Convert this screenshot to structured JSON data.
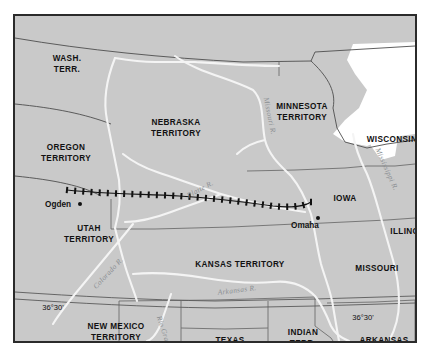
{
  "map": {
    "title": "Union Pacific Railroad route across western territories, c. 1860",
    "frame": {
      "border_color": "#2b2b2b",
      "land_color": "#c9c9c9",
      "water_color": "#ffffff",
      "river_color": "#f2f2f2",
      "boundary_color": "#6a6a6a",
      "label_color": "#111111",
      "river_label_color": "#8b8f93",
      "railroad_color": "#111111"
    },
    "regions": [
      {
        "name": "wash-terr",
        "label": "WASH.\nTERR.",
        "lines": [
          "WASH.",
          "TERR."
        ],
        "x": 52,
        "y": 48
      },
      {
        "name": "oregon-territory",
        "label": "OREGON\nTERRITORY",
        "lines": [
          "OREGON",
          "TERRITORY"
        ],
        "x": 51,
        "y": 137
      },
      {
        "name": "utah-territory",
        "label": "UTAH\nTERRITORY",
        "lines": [
          "UTAH",
          "TERRITORY"
        ],
        "x": 74,
        "y": 218
      },
      {
        "name": "new-mexico-territory",
        "label": "NEW MEXICO\nTERRITORY",
        "lines": [
          "NEW MEXICO",
          "TERRITORY"
        ],
        "x": 101,
        "y": 316
      },
      {
        "name": "nebraska-territory",
        "label": "NEBRASKA\nTERRITORY",
        "lines": [
          "NEBRASKA",
          "TERRITORY"
        ],
        "x": 161,
        "y": 112
      },
      {
        "name": "kansas-territory",
        "label": "KANSAS TERRITORY",
        "lines": [
          "KANSAS  TERRITORY"
        ],
        "x": 225,
        "y": 249
      },
      {
        "name": "texas",
        "label": "TEXAS",
        "lines": [
          "TEXAS"
        ],
        "x": 215,
        "y": 325
      },
      {
        "name": "indian-terr",
        "label": "INDIAN\nTERR.",
        "lines": [
          "INDIAN",
          "TERR."
        ],
        "x": 288,
        "y": 322
      },
      {
        "name": "minnesota-territory",
        "label": "MINNESOTA\nTERRITORY",
        "lines": [
          "MINNESOTA",
          "TERRITORY"
        ],
        "x": 287,
        "y": 96
      },
      {
        "name": "iowa",
        "label": "IOWA",
        "lines": [
          "IOWA"
        ],
        "x": 330,
        "y": 183
      },
      {
        "name": "missouri",
        "label": "MISSOURI",
        "lines": [
          "MISSOURI"
        ],
        "x": 362,
        "y": 253
      },
      {
        "name": "arkansas",
        "label": "ARKANSAS",
        "lines": [
          "ARKANSAS"
        ],
        "x": 369,
        "y": 325
      },
      {
        "name": "wisconsin",
        "label": "WISCONSIN",
        "lines": [
          "WISCONSIN"
        ],
        "x": 377,
        "y": 124
      },
      {
        "name": "illinois",
        "label": "ILLINOIS",
        "lines": [
          "ILLINOIS"
        ],
        "x": 394,
        "y": 216
      }
    ],
    "cities": [
      {
        "name": "ogden",
        "label": "Ogden",
        "label_x": 43,
        "label_y": 188,
        "dot_x": 65,
        "dot_y": 188
      },
      {
        "name": "omaha",
        "label": "Omaha",
        "label_x": 290,
        "label_y": 209,
        "dot_x": 303,
        "dot_y": 202
      }
    ],
    "rivers": [
      {
        "name": "platte-river",
        "label": "Platte R.",
        "x": 185,
        "y": 173,
        "rotate": -28
      },
      {
        "name": "missouri-river",
        "label": "Missouri R.",
        "x": 255,
        "y": 100,
        "rotate": 78
      },
      {
        "name": "mississippi-river",
        "label": "Mississippi R.",
        "x": 372,
        "y": 153,
        "rotate": 66
      },
      {
        "name": "colorado-river",
        "label": "Colorado R.",
        "x": 93,
        "y": 257,
        "rotate": -47
      },
      {
        "name": "rio-grande",
        "label": "Rio Grande",
        "x": 150,
        "y": 318,
        "rotate": 72
      },
      {
        "name": "arkansas-river",
        "label": "Arkansas R.",
        "x": 222,
        "y": 274,
        "rotate": -7
      }
    ],
    "latitude_markers": [
      {
        "name": "lat-36-30-west",
        "label": "36°30'",
        "x": 38,
        "y": 291
      },
      {
        "name": "lat-36-30-east",
        "label": "36°30'",
        "x": 348,
        "y": 301
      }
    ],
    "railroad": {
      "name": "union-pacific-railroad",
      "symbol": "cross-tie-track",
      "tie_count": 30
    },
    "water_bodies": [
      {
        "name": "lake-superior",
        "label": ""
      }
    ]
  }
}
